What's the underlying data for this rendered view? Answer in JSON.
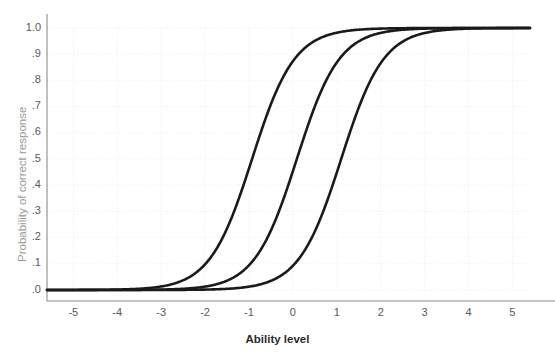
{
  "chart_data": {
    "type": "line",
    "title": "",
    "subtitle": "",
    "xlabel": "Ability level",
    "ylabel": "Probability of correct response",
    "xlim": [
      -5.6,
      5.4
    ],
    "ylim": [
      0.0,
      1.0
    ],
    "grid": true,
    "grid_color": "#e8e8ea",
    "legend": "none",
    "line_color": "#1a1a1a",
    "line_width": 2.6,
    "xticks": [
      -5,
      -4,
      -3,
      -2,
      -1,
      0,
      1,
      2,
      3,
      4,
      5
    ],
    "xtick_labels": [
      "-5",
      "-4",
      "-3",
      "-2",
      "-1",
      "0",
      "1",
      "2",
      "3",
      "4",
      "5"
    ],
    "yticks": [
      0.0,
      0.1,
      0.2,
      0.3,
      0.4,
      0.5,
      0.6,
      0.7,
      0.8,
      0.9,
      1.0
    ],
    "ytick_labels": [
      ".0",
      ".1",
      ".2",
      ".3",
      ".4",
      ".5",
      ".6",
      ".7",
      ".8",
      ".9",
      "1.0"
    ],
    "model": "2PL item characteristic curve",
    "series": [
      {
        "name": "Item 1",
        "difficulty_b": -0.93,
        "discrimination_a": 1.22,
        "guessing_c": 0.0,
        "x": [
          -5.6,
          -5.0,
          -4.5,
          -4.0,
          -3.5,
          -3.0,
          -2.5,
          -2.0,
          -1.5,
          -1.0,
          -0.93,
          -0.5,
          0.0,
          0.5,
          1.0,
          1.5,
          2.0,
          2.5,
          3.0,
          3.5,
          4.0,
          4.5,
          5.0,
          5.4
        ],
        "values": [
          0.004,
          0.008,
          0.014,
          0.025,
          0.045,
          0.08,
          0.138,
          0.227,
          0.352,
          0.503,
          0.5,
          0.643,
          0.759,
          0.852,
          0.914,
          0.952,
          0.974,
          0.986,
          0.992,
          0.996,
          0.998,
          0.999,
          0.999,
          1.0
        ]
      },
      {
        "name": "Item 2",
        "difficulty_b": 0.09,
        "discrimination_a": 1.22,
        "guessing_c": 0.0,
        "x": [
          -5.6,
          -5.0,
          -4.5,
          -4.0,
          -3.5,
          -3.0,
          -2.5,
          -2.0,
          -1.5,
          -1.0,
          -0.5,
          0.0,
          0.09,
          0.5,
          1.0,
          1.5,
          2.0,
          2.5,
          3.0,
          3.5,
          4.0,
          4.5,
          5.0,
          5.4
        ],
        "values": [
          0.001,
          0.002,
          0.004,
          0.007,
          0.013,
          0.024,
          0.043,
          0.076,
          0.129,
          0.211,
          0.33,
          0.473,
          0.5,
          0.62,
          0.749,
          0.845,
          0.91,
          0.95,
          0.973,
          0.985,
          0.992,
          0.996,
          0.998,
          0.999
        ]
      },
      {
        "name": "Item 3",
        "difficulty_b": 1.1,
        "discrimination_a": 1.22,
        "guessing_c": 0.0,
        "x": [
          -5.6,
          -5.0,
          -4.5,
          -4.0,
          -3.5,
          -3.0,
          -2.5,
          -2.0,
          -1.5,
          -1.0,
          -0.5,
          0.0,
          0.5,
          1.0,
          1.1,
          1.5,
          2.0,
          2.5,
          3.0,
          3.5,
          4.0,
          4.5,
          5.0,
          5.4
        ],
        "values": [
          0.0003,
          0.0006,
          0.001,
          0.002,
          0.004,
          0.007,
          0.012,
          0.022,
          0.039,
          0.068,
          0.116,
          0.192,
          0.3,
          0.436,
          0.5,
          0.619,
          0.757,
          0.853,
          0.914,
          0.951,
          0.973,
          0.985,
          0.992,
          0.995
        ]
      }
    ],
    "axes_color": "#8c8c8c",
    "tick_label_color": "#58595b"
  },
  "axis": {
    "x_title": "Ability level",
    "y_title": "Probability of correct response",
    "x_tick_labels": [
      "-5",
      "-4",
      "-3",
      "-2",
      "-1",
      "0",
      "1",
      "2",
      "3",
      "4",
      "5"
    ],
    "y_tick_labels": [
      "1.0",
      ".9",
      ".8",
      ".7",
      ".6",
      ".5",
      ".4",
      ".3",
      ".2",
      ".1",
      ".0"
    ]
  }
}
